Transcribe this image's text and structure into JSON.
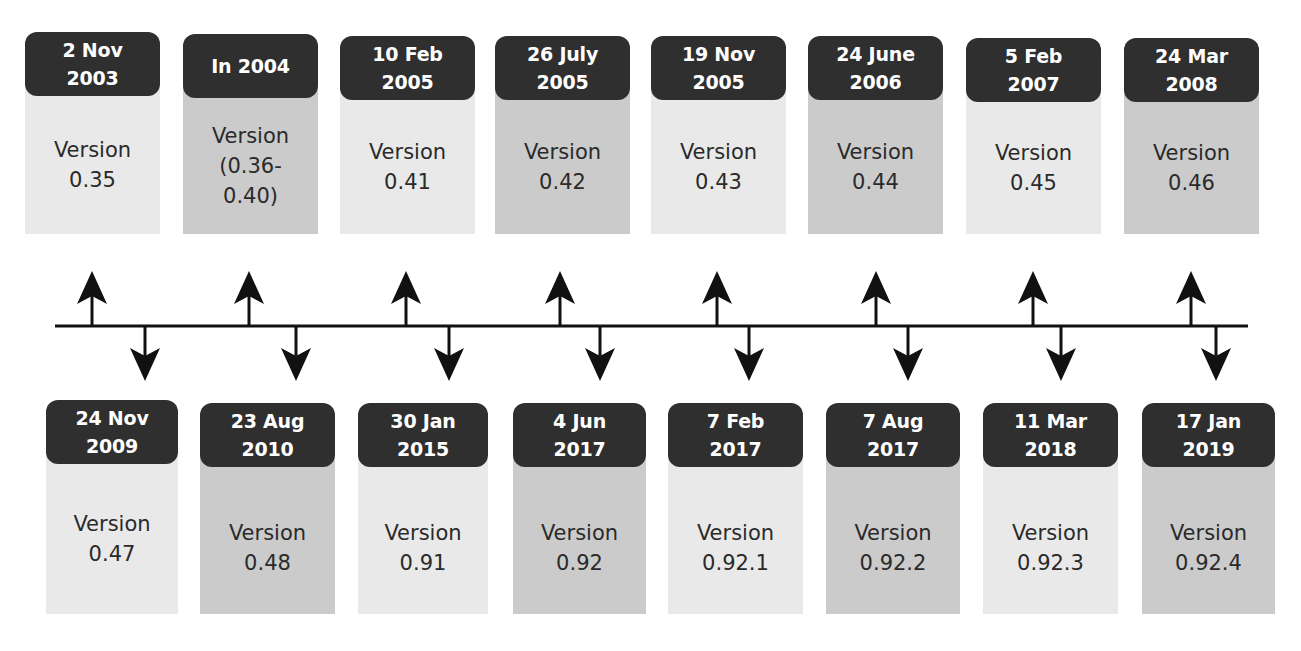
{
  "diagram": {
    "type": "timeline",
    "title_fragment": "",
    "top_row": [
      {
        "date_line1": "2 Nov",
        "date_line2": "2003",
        "version_label": "Version",
        "version": "0.35",
        "shade": "light"
      },
      {
        "date_line1": "In 2004",
        "date_line2": "",
        "version_label": "Version",
        "version": "(0.36-",
        "version_line2": "0.40)",
        "shade": "dark"
      },
      {
        "date_line1": "10 Feb",
        "date_line2": "2005",
        "version_label": "Version",
        "version": "0.41",
        "shade": "light"
      },
      {
        "date_line1": "26 July",
        "date_line2": "2005",
        "version_label": "Version",
        "version": "0.42",
        "shade": "dark"
      },
      {
        "date_line1": "19 Nov",
        "date_line2": "2005",
        "version_label": "Version",
        "version": "0.43",
        "shade": "light"
      },
      {
        "date_line1": "24 June",
        "date_line2": "2006",
        "version_label": "Version",
        "version": "0.44",
        "shade": "dark"
      },
      {
        "date_line1": "5 Feb",
        "date_line2": "2007",
        "version_label": "Version",
        "version": "0.45",
        "shade": "light"
      },
      {
        "date_line1": "24 Mar",
        "date_line2": "2008",
        "version_label": "Version",
        "version": "0.46",
        "shade": "dark"
      }
    ],
    "bottom_row": [
      {
        "date_line1": "24 Nov",
        "date_line2": "2009",
        "version_label": "Version",
        "version": "0.47",
        "shade": "light"
      },
      {
        "date_line1": "23 Aug",
        "date_line2": "2010",
        "version_label": "Version",
        "version": "0.48",
        "shade": "dark"
      },
      {
        "date_line1": "30 Jan",
        "date_line2": "2015",
        "version_label": "Version",
        "version": "0.91",
        "shade": "light"
      },
      {
        "date_line1": "4 Jun",
        "date_line2": "2017",
        "version_label": "Version",
        "version": "0.92",
        "shade": "dark"
      },
      {
        "date_line1": "7 Feb",
        "date_line2": "2017",
        "version_label": "Version",
        "version": "0.92.1",
        "shade": "light"
      },
      {
        "date_line1": "7 Aug",
        "date_line2": "2017",
        "version_label": "Version",
        "version": "0.92.2",
        "shade": "dark"
      },
      {
        "date_line1": "11 Mar",
        "date_line2": "2018",
        "version_label": "Version",
        "version": "0.92.3",
        "shade": "light"
      },
      {
        "date_line1": "17 Jan",
        "date_line2": "2019",
        "version_label": "Version",
        "version": "0.92.4",
        "shade": "dark"
      }
    ],
    "colors": {
      "header_bg": "#2f2f2f",
      "header_text": "#ffffff",
      "body_light": "#e9e9e9",
      "body_dark": "#cbcbcb",
      "body_text": "#2a2a2a",
      "line": "#111111"
    }
  }
}
